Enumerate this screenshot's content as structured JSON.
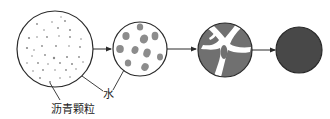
{
  "diagram": {
    "type": "process-flow",
    "colors": {
      "outline": "#2a2a2a",
      "particle": "#8a8a8a",
      "floc": "#8c8c8c",
      "coalesced": "#707070",
      "film": "#484848",
      "water": "#ffffff"
    },
    "stages": [
      {
        "id": "stage-1",
        "name": "dispersed-particles",
        "cx": 55,
        "cy": 49,
        "r": 38
      },
      {
        "id": "stage-2",
        "name": "flocculation",
        "cx": 140,
        "cy": 49,
        "r": 27
      },
      {
        "id": "stage-3",
        "name": "coalescence",
        "cx": 225,
        "cy": 50,
        "r": 27
      },
      {
        "id": "stage-4",
        "name": "continuous-film",
        "cx": 299,
        "cy": 50,
        "r": 23
      }
    ],
    "labels": {
      "water": "水",
      "asphalt_particles": "沥青颗粒"
    }
  }
}
